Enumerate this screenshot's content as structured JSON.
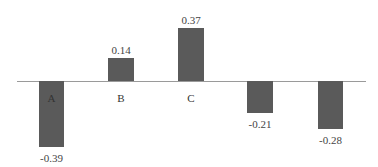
{
  "chart_data": {
    "type": "bar",
    "title": "",
    "xlabel": "",
    "ylabel": "",
    "grid": false,
    "legend": null,
    "categories": [
      "A",
      "B",
      "C",
      "",
      ""
    ],
    "values": [
      -0.39,
      0.14,
      0.37,
      -0.21,
      -0.28
    ],
    "value_labels": [
      "-0.39",
      "0.14",
      "0.37",
      "-0.21",
      "-0.28"
    ],
    "ylim": [
      -0.4,
      0.4
    ],
    "colors": {
      "bar": "#5a5a5a",
      "axis": "#9a9a9a",
      "text": "#444444"
    }
  },
  "layout": {
    "axis": {
      "x1": 17,
      "x2": 366,
      "y": 81
    },
    "bars": [
      {
        "x": 39,
        "w": 25,
        "top": 81,
        "bottom": 147,
        "label_y": 152,
        "cat_y": 92
      },
      {
        "x": 108,
        "w": 26,
        "top": 58,
        "bottom": 81,
        "label_y": 44,
        "cat_y": 92
      },
      {
        "x": 178,
        "w": 26,
        "top": 28,
        "bottom": 81,
        "label_y": 14,
        "cat_y": 92
      },
      {
        "x": 247,
        "w": 26,
        "top": 81,
        "bottom": 113,
        "label_y": 118,
        "cat_y": 92
      },
      {
        "x": 318,
        "w": 25,
        "top": 81,
        "bottom": 129,
        "label_y": 134,
        "cat_y": 92
      }
    ]
  }
}
